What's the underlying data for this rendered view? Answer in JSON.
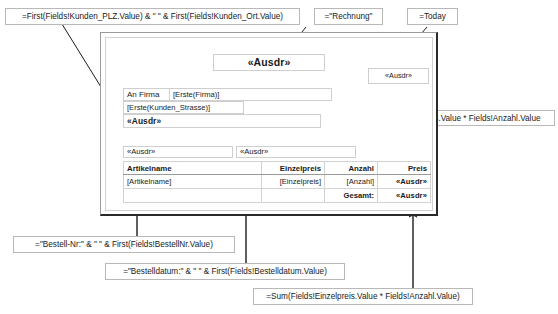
{
  "annotations": {
    "plz_ort": "=First(Fields!Kunden_PLZ.Value) & \" \" & First(Fields!Kunden_Ort.Value)",
    "rechnung": "=\"Rechnung\"",
    "today": "=Today",
    "preis_formula": "=Fields!Einzelpreis.Value * Fields!Anzahl.Value",
    "bestellnr": "=\"Bestell-Nr:\" & \" \" & First(Fields!BestellNr.Value)",
    "bestelldatum": "=\"Bestelldatum:\" & \" \" & First(Fields!Bestelldatum.Value)",
    "gesamt_formula": "=Sum(Fields!Einzelpreis.Value * Fields!Anzahl.Value)"
  },
  "report": {
    "title_field": "«Ausdr»",
    "date_field": "«Ausdr»",
    "label_an_firma": "An Firma",
    "field_firma": "[Erste(Firma)]",
    "field_strasse": "[Erste(Kunden_Strasse)]",
    "field_plz_ort": "«Ausdr»",
    "field_bestellnr": "«Ausdr»",
    "field_bestelldatum": "«Ausdr»",
    "table": {
      "headers": [
        "Artikelname",
        "Einzelpreis",
        "Anzahl",
        "Preis"
      ],
      "detail_row": [
        "[Artikelname]",
        "[Einzelpreis]",
        "[Anzahl]",
        "«Ausdr»"
      ],
      "total_row": [
        "",
        "",
        "Gesamt:",
        "«Ausdr»"
      ]
    }
  },
  "colors": {
    "callout_border": "#b8b8b8",
    "field_border": "#cfcfcf",
    "frame_shadow": "#2a2a2a",
    "connector": "#1a1a1a"
  }
}
